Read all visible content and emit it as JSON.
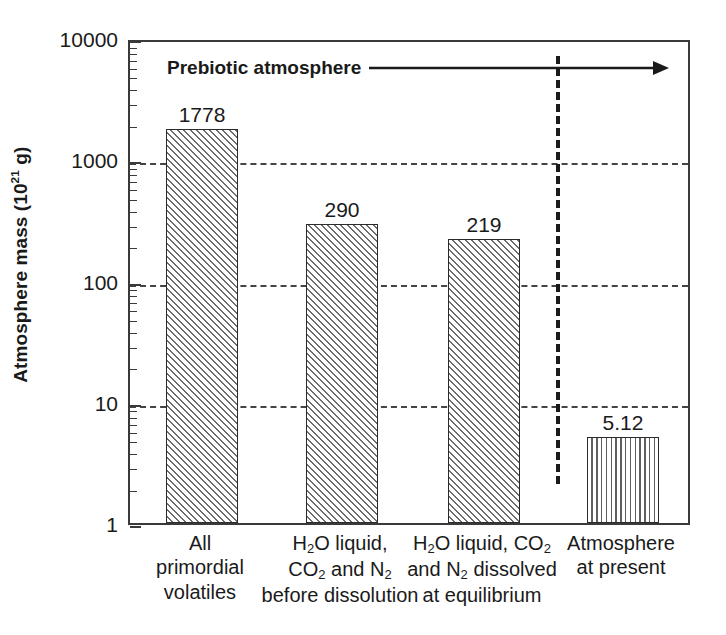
{
  "chart_data": {
    "type": "bar",
    "title": "",
    "xlabel": "",
    "ylabel": "Atmosphere mass (10^21 g)",
    "ylabel_parts": {
      "pre": "Atmosphere mass (10",
      "sup": "21",
      "post": " g)"
    },
    "yscale": "log",
    "ylim": [
      1,
      10000
    ],
    "ytick_labels": [
      "10000",
      "1000",
      "100",
      "10",
      "1"
    ],
    "ytick_values": [
      10000,
      1000,
      100,
      10,
      1
    ],
    "grid": "horizontal dashed at 1000, 100, 10",
    "legend": "none",
    "categories": [
      "All primordial volatiles",
      "H2O liquid, CO2 and N2 before dissolution",
      "H2O liquid, CO2 and N2 dissolved at equilibrium",
      "Atmosphere at present"
    ],
    "category_label_lines": [
      [
        "All",
        "primordial",
        "volatiles"
      ],
      [
        "H|2|O liquid,",
        "CO|2| and N|2|",
        "before dissolution"
      ],
      [
        "H|2|O liquid, CO|2|",
        "and N|2| dissolved",
        "at equilibrium"
      ],
      [
        "Atmosphere",
        "at present"
      ]
    ],
    "values": [
      1778,
      290,
      219,
      5.12
    ],
    "value_labels": [
      "1778",
      "290",
      "219",
      "5.12"
    ],
    "bar_fills": [
      "diagonal-hatch",
      "diagonal-hatch",
      "diagonal-hatch",
      "vertical-hatch"
    ],
    "annotations": [
      {
        "name": "prebiotic-atmosphere",
        "text": "Prebiotic atmosphere",
        "style": "bold label with rightward arrow",
        "spans_categories": [
          1,
          3
        ]
      },
      {
        "name": "prebiotic-divider",
        "text": "",
        "style": "vertical dashed separator between category 3 and 4"
      }
    ]
  },
  "colors": {
    "background": "#ffffff",
    "axis": "#3a3a3a",
    "text": "#1a1a1a",
    "hatch": "#6d6d6d",
    "gridline": "#444444"
  }
}
